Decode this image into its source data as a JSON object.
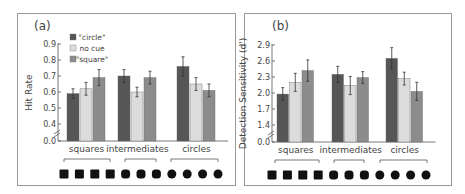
{
  "colors": {
    "circle_cue": "#565656",
    "no_cue": "#dcdcdc",
    "square_cue": "#8c8c8c",
    "error_bar": "#333333",
    "axis": "#555555",
    "shape_fill": "#111111",
    "frame": "#9a9a9a"
  },
  "legend": [
    {
      "label": "\"circle\"",
      "color_key": "circle_cue"
    },
    {
      "label": "no cue",
      "color_key": "no_cue"
    },
    {
      "label": "\"square\"",
      "color_key": "square_cue"
    }
  ],
  "shape_row": {
    "shapes": [
      "square",
      "square",
      "square",
      "square",
      "rounded",
      "rounded",
      "rounded",
      "circle",
      "circle",
      "circle",
      "circle"
    ]
  },
  "chart_data": [
    {
      "panel_label": "(a)",
      "type": "bar",
      "title": "",
      "xlabel": "",
      "ylabel": "Hit Rate",
      "categories": [
        "squares",
        "intermediates",
        "circles"
      ],
      "yticks": [
        "0.0",
        "0.4",
        "0.5",
        "0.6",
        "0.7",
        "0.8",
        "0.9"
      ],
      "ylim": [
        0.0,
        0.9
      ],
      "axis_break": true,
      "legend_position": "top-left",
      "series": [
        {
          "name": "\"circle\"",
          "values": [
            0.59,
            0.7,
            0.76
          ],
          "errors": [
            0.03,
            0.04,
            0.06
          ]
        },
        {
          "name": "no cue",
          "values": [
            0.62,
            0.6,
            0.65
          ],
          "errors": [
            0.04,
            0.03,
            0.04
          ]
        },
        {
          "name": "\"square\"",
          "values": [
            0.69,
            0.69,
            0.61
          ],
          "errors": [
            0.05,
            0.04,
            0.04
          ]
        }
      ]
    },
    {
      "panel_label": "(b)",
      "type": "bar",
      "title": "",
      "xlabel": "",
      "ylabel": "Detection Sensitivity (d')",
      "categories": [
        "squares",
        "intermediates",
        "circles"
      ],
      "yticks": [
        "0.0",
        "1.4",
        "1.7",
        "2.0",
        "2.3",
        "2.6",
        "2.9"
      ],
      "ylim": [
        0.0,
        2.9
      ],
      "axis_break": true,
      "series": [
        {
          "name": "\"circle\"",
          "values": [
            1.98,
            2.35,
            2.65
          ],
          "errors": [
            0.12,
            0.15,
            0.2
          ]
        },
        {
          "name": "no cue",
          "values": [
            2.2,
            2.14,
            2.27
          ],
          "errors": [
            0.17,
            0.17,
            0.12
          ]
        },
        {
          "name": "\"square\"",
          "values": [
            2.42,
            2.29,
            2.03
          ],
          "errors": [
            0.2,
            0.11,
            0.17
          ]
        }
      ]
    }
  ]
}
